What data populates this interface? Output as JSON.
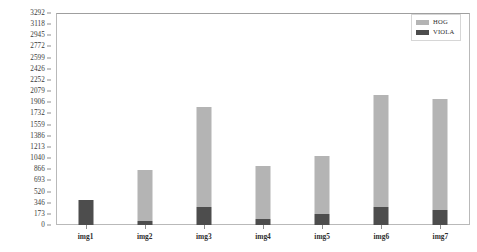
{
  "chart_data": {
    "type": "bar",
    "stacked": true,
    "title": "",
    "xlabel": "",
    "ylabel": "",
    "categories": [
      "img1",
      "img2",
      "img3",
      "img4",
      "img5",
      "img6",
      "img7"
    ],
    "series": [
      {
        "name": "VIOLA",
        "color": "#4d4d4d",
        "values": [
          388,
          62,
          280,
          93,
          171,
          280,
          233
        ]
      },
      {
        "name": "HOG",
        "color": "#b4b4b4",
        "values": [
          0,
          792,
          1553,
          823,
          900,
          1739,
          1724
        ]
      }
    ],
    "totals": [
      388,
      854,
      1833,
      916,
      1071,
      2019,
      1957
    ],
    "ylim": [
      0,
      3292
    ],
    "ytick_labels": [
      "0",
      "173",
      "346",
      "520",
      "693",
      "866",
      "1040",
      "1213",
      "1386",
      "1559",
      "1732",
      "1906",
      "2079",
      "2252",
      "2426",
      "2599",
      "2772",
      "2945",
      "3118",
      "3292"
    ],
    "ytick_values": [
      0,
      173,
      346,
      520,
      693,
      866,
      1040,
      1213,
      1386,
      1559,
      1732,
      1906,
      2079,
      2252,
      2426,
      2599,
      2772,
      2945,
      3118,
      3292
    ],
    "grid": false,
    "legend_position": "top-right",
    "legend": [
      {
        "label": "HOG",
        "color": "#b4b4b4"
      },
      {
        "label": "VIOLA",
        "color": "#4d4d4d"
      }
    ]
  }
}
